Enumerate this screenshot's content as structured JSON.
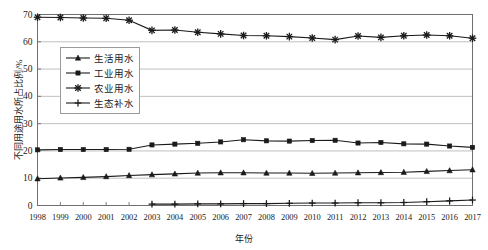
{
  "chart_data": {
    "type": "line",
    "title": "",
    "xlabel": "年份",
    "ylabel": "不同用途用水所占比例/%",
    "grid": true,
    "legend_position": "upper-left-inside",
    "xlim": [
      1998,
      2017
    ],
    "ylim": [
      0,
      70
    ],
    "ytick_values": [
      0,
      10,
      20,
      30,
      40,
      50,
      60,
      70
    ],
    "categories": [
      "1998",
      "1999",
      "2000",
      "2001",
      "2002",
      "2003",
      "2004",
      "2005",
      "2006",
      "2007",
      "2008",
      "2009",
      "2010",
      "2011",
      "2012",
      "2013",
      "2014",
      "2015",
      "2016",
      "2017"
    ],
    "series": [
      {
        "name": "生活用水",
        "marker": "triangle",
        "color": "#1a1a1a",
        "values": [
          9.8,
          10.1,
          10.3,
          10.6,
          11.0,
          11.3,
          11.6,
          11.9,
          12.0,
          12.0,
          11.9,
          11.9,
          11.8,
          11.9,
          12.0,
          12.1,
          12.2,
          12.5,
          12.8,
          13.1
        ]
      },
      {
        "name": "工业用水",
        "marker": "square",
        "color": "#1a1a1a",
        "values": [
          20.4,
          20.5,
          20.5,
          20.5,
          20.6,
          22.2,
          22.5,
          22.8,
          23.3,
          24.1,
          23.7,
          23.6,
          23.8,
          23.9,
          22.9,
          23.1,
          22.6,
          22.5,
          21.8,
          21.3
        ]
      },
      {
        "name": "农业用水",
        "marker": "asterisk",
        "color": "#1a1a1a",
        "values": [
          69.0,
          68.9,
          68.7,
          68.6,
          67.9,
          64.2,
          64.3,
          63.5,
          62.9,
          62.3,
          62.2,
          61.9,
          61.4,
          60.8,
          62.1,
          61.6,
          62.2,
          62.5,
          62.2,
          61.3
        ]
      },
      {
        "name": "生态补水",
        "marker": "plus",
        "color": "#1a1a1a",
        "values": [
          null,
          null,
          null,
          null,
          null,
          0.5,
          0.5,
          0.6,
          0.6,
          0.7,
          0.7,
          0.8,
          0.9,
          0.9,
          1.0,
          1.0,
          1.1,
          1.4,
          1.7,
          2.0
        ]
      }
    ]
  },
  "axis": {
    "y_ticks": [
      "0",
      "10",
      "20",
      "30",
      "40",
      "50",
      "60",
      "70"
    ],
    "x_ticks": [
      "1998",
      "1999",
      "2000",
      "2001",
      "2002",
      "2003",
      "2004",
      "2005",
      "2006",
      "2007",
      "2008",
      "2009",
      "2010",
      "2011",
      "2012",
      "2013",
      "2014",
      "2015",
      "2016",
      "2017"
    ],
    "y_title": "不同用途用水所占比例/%",
    "x_title": "年份"
  },
  "legend": {
    "items": [
      {
        "label": "生活用水",
        "marker": "triangle"
      },
      {
        "label": "工业用水",
        "marker": "square"
      },
      {
        "label": "农业用水",
        "marker": "asterisk"
      },
      {
        "label": "生态补水",
        "marker": "plus"
      }
    ]
  },
  "style": {
    "line_color": "#1a1a1a",
    "grid_color": "#b9b9b9",
    "axis_color": "#6f6f6f",
    "background": "#ffffff"
  }
}
